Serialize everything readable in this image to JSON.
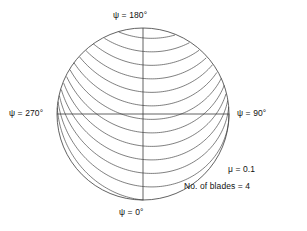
{
  "figure": {
    "background_color": "#ffffff",
    "line_color": "#3a3a3a",
    "text_color": "#111111"
  },
  "labels": {
    "psi_180": "ψ = 180°",
    "psi_0": "ψ = 0°",
    "psi_270": "ψ = 270°",
    "psi_90": "ψ = 90°"
  },
  "annotations": {
    "advance_ratio": "μ = 0.1",
    "blade_count": "No. of blades = 4"
  },
  "chart_data": {
    "type": "line",
    "xlabel": "",
    "ylabel": "",
    "grid": false,
    "legend_position": "none",
    "axis_ranges": {
      "x": [
        -1.45,
        1.45
      ],
      "y": [
        -1.45,
        1.45
      ]
    },
    "parameters": {
      "advance_ratio_mu": 0.1,
      "number_of_blades": 4,
      "rotor_radius": 1.0,
      "vortex_age_max_deg": 1260,
      "rotation_sense": "counterclockwise_in_plot"
    },
    "azimuth_markers": [
      {
        "label": "ψ = 0°",
        "angle_deg": 0,
        "position": "bottom"
      },
      {
        "label": "ψ = 90°",
        "angle_deg": 90,
        "position": "right"
      },
      {
        "label": "ψ = 180°",
        "angle_deg": 180,
        "position": "top"
      },
      {
        "label": "ψ = 270°",
        "angle_deg": 270,
        "position": "left"
      }
    ],
    "geometry": {
      "center_px": [
        143,
        114
      ],
      "radius_px": 86,
      "disc_circle": true,
      "horizontal_axis": true,
      "vertical_axis": true
    },
    "series": [
      {
        "name": "tip vortex trail, blade 1",
        "blade_index": 0,
        "release_azimuth_deg": 0
      },
      {
        "name": "tip vortex trail, blade 2",
        "blade_index": 1,
        "release_azimuth_deg": 90
      },
      {
        "name": "tip vortex trail, blade 3",
        "blade_index": 2,
        "release_azimuth_deg": 180
      },
      {
        "name": "tip vortex trail, blade 4",
        "blade_index": 3,
        "release_azimuth_deg": 270
      }
    ]
  }
}
